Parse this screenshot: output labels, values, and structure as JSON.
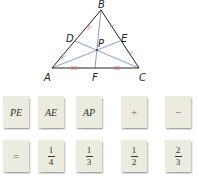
{
  "diagram": {
    "points": {
      "A": {
        "label": "A",
        "x": 52,
        "y": 68
      },
      "B": {
        "label": "B",
        "x": 101,
        "y": 10
      },
      "C": {
        "label": "C",
        "x": 139,
        "y": 68
      },
      "D": {
        "label": "D",
        "x": 75,
        "y": 41
      },
      "E": {
        "label": "E",
        "x": 120,
        "y": 41
      },
      "F": {
        "label": "F",
        "x": 95,
        "y": 68
      },
      "P": {
        "label": "P",
        "x": 97,
        "y": 50
      }
    },
    "triangle_color": "#222222",
    "median_color": "#6f84b8",
    "tick_color": "#d0605a"
  },
  "tiles": {
    "row1": [
      {
        "label": "PE",
        "kind": "term"
      },
      {
        "label": "AE",
        "kind": "term"
      },
      {
        "label": "AP",
        "kind": "term"
      },
      {
        "label": "+",
        "kind": "operator"
      },
      {
        "label": "−",
        "kind": "operator"
      }
    ],
    "row2": [
      {
        "label": "=",
        "kind": "operator"
      },
      {
        "label": "1/4",
        "num": "1",
        "den": "4",
        "kind": "fraction"
      },
      {
        "label": "1/3",
        "num": "1",
        "den": "3",
        "kind": "fraction"
      },
      {
        "label": "1/2",
        "num": "1",
        "den": "2",
        "kind": "fraction"
      },
      {
        "label": "2/3",
        "num": "2",
        "den": "3",
        "kind": "fraction"
      }
    ]
  }
}
